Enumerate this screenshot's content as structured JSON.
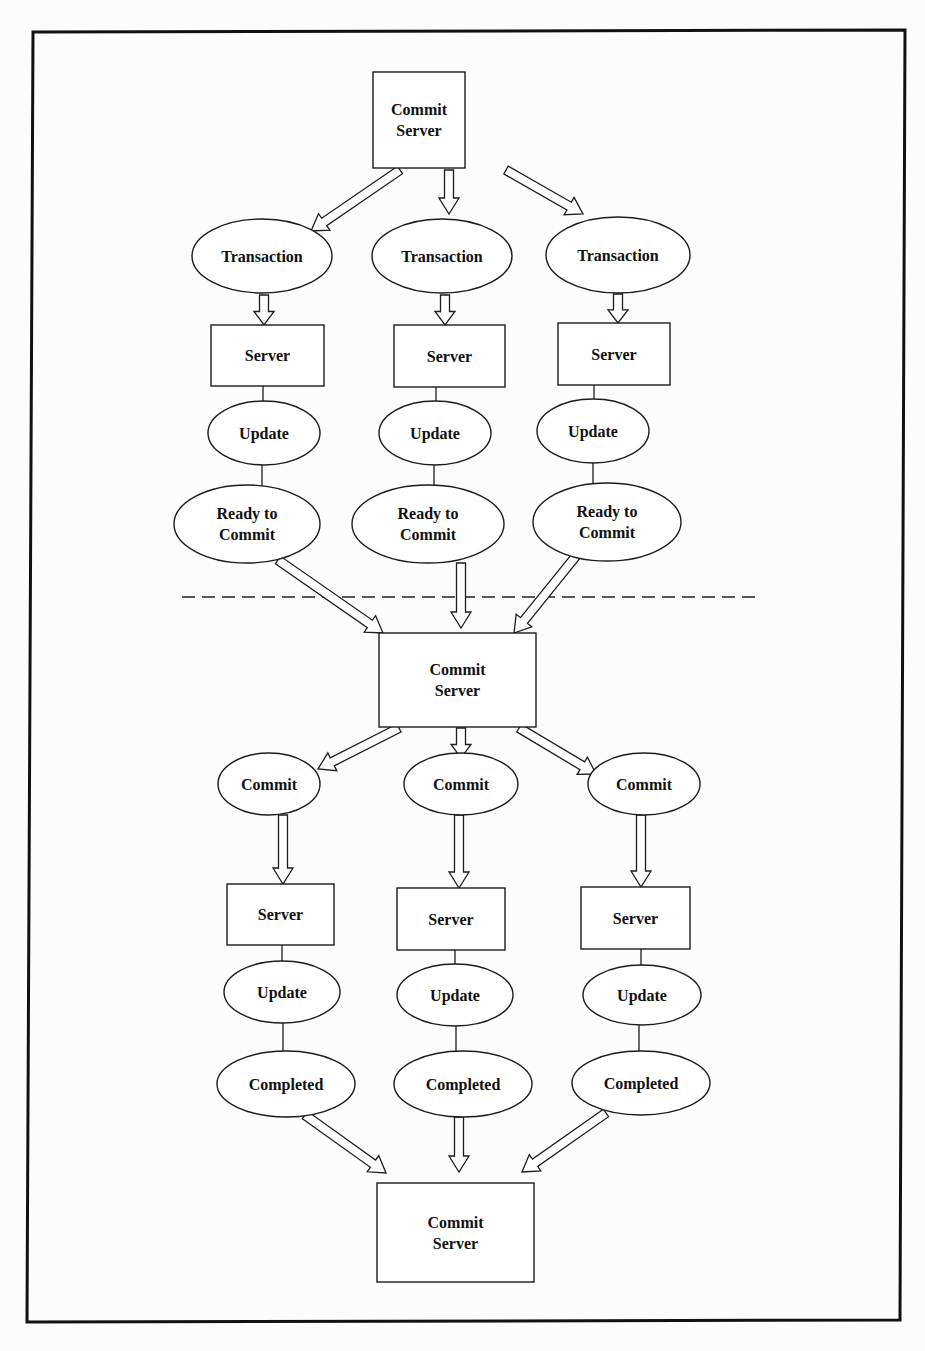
{
  "diagram": {
    "phase_divider": {
      "style": "dashed",
      "x1": 182,
      "x2": 762,
      "y": 597
    },
    "frame": {
      "corners": [
        [
          33,
          32
        ],
        [
          905,
          30
        ],
        [
          900,
          1320
        ],
        [
          27,
          1322
        ]
      ]
    },
    "nodes": [
      {
        "id": "commit-server-top",
        "shape": "rect",
        "lines": [
          "Commit",
          "Server"
        ],
        "x": 373,
        "y": 72,
        "w": 92,
        "h": 96
      },
      {
        "id": "transaction-1",
        "shape": "ellipse",
        "lines": [
          "Transaction"
        ],
        "cx": 262,
        "cy": 256,
        "rx": 70,
        "ry": 37
      },
      {
        "id": "transaction-2",
        "shape": "ellipse",
        "lines": [
          "Transaction"
        ],
        "cx": 442,
        "cy": 256,
        "rx": 70,
        "ry": 37
      },
      {
        "id": "transaction-3",
        "shape": "ellipse",
        "lines": [
          "Transaction"
        ],
        "cx": 618,
        "cy": 255,
        "rx": 72,
        "ry": 38
      },
      {
        "id": "server-p1-1",
        "shape": "rect",
        "lines": [
          "Server"
        ],
        "x": 211,
        "y": 325,
        "w": 113,
        "h": 61
      },
      {
        "id": "server-p1-2",
        "shape": "rect",
        "lines": [
          "Server"
        ],
        "x": 394,
        "y": 325,
        "w": 111,
        "h": 62
      },
      {
        "id": "server-p1-3",
        "shape": "rect",
        "lines": [
          "Server"
        ],
        "x": 558,
        "y": 323,
        "w": 112,
        "h": 62
      },
      {
        "id": "update-p1-1",
        "shape": "ellipse",
        "lines": [
          "Update"
        ],
        "cx": 264,
        "cy": 433,
        "rx": 56,
        "ry": 32
      },
      {
        "id": "update-p1-2",
        "shape": "ellipse",
        "lines": [
          "Update"
        ],
        "cx": 435,
        "cy": 433,
        "rx": 56,
        "ry": 32
      },
      {
        "id": "update-p1-3",
        "shape": "ellipse",
        "lines": [
          "Update"
        ],
        "cx": 593,
        "cy": 431,
        "rx": 56,
        "ry": 32
      },
      {
        "id": "ready-1",
        "shape": "ellipse",
        "lines": [
          "Ready to",
          "Commit"
        ],
        "cx": 247,
        "cy": 524,
        "rx": 73,
        "ry": 39
      },
      {
        "id": "ready-2",
        "shape": "ellipse",
        "lines": [
          "Ready to",
          "Commit"
        ],
        "cx": 428,
        "cy": 524,
        "rx": 76,
        "ry": 39
      },
      {
        "id": "ready-3",
        "shape": "ellipse",
        "lines": [
          "Ready to",
          "Commit"
        ],
        "cx": 607,
        "cy": 522,
        "rx": 74,
        "ry": 39
      },
      {
        "id": "commit-server-mid",
        "shape": "rect",
        "lines": [
          "Commit",
          "Server"
        ],
        "x": 379,
        "y": 633,
        "w": 157,
        "h": 94
      },
      {
        "id": "commit-1",
        "shape": "ellipse",
        "lines": [
          "Commit"
        ],
        "cx": 269,
        "cy": 784,
        "rx": 51,
        "ry": 31
      },
      {
        "id": "commit-2",
        "shape": "ellipse",
        "lines": [
          "Commit"
        ],
        "cx": 461,
        "cy": 784,
        "rx": 57,
        "ry": 31
      },
      {
        "id": "commit-3",
        "shape": "ellipse",
        "lines": [
          "Commit"
        ],
        "cx": 644,
        "cy": 784,
        "rx": 56,
        "ry": 31
      },
      {
        "id": "server-p2-1",
        "shape": "rect",
        "lines": [
          "Server"
        ],
        "x": 227,
        "y": 884,
        "w": 107,
        "h": 61
      },
      {
        "id": "server-p2-2",
        "shape": "rect",
        "lines": [
          "Server"
        ],
        "x": 397,
        "y": 888,
        "w": 108,
        "h": 62
      },
      {
        "id": "server-p2-3",
        "shape": "rect",
        "lines": [
          "Server"
        ],
        "x": 581,
        "y": 887,
        "w": 109,
        "h": 62
      },
      {
        "id": "update-p2-1",
        "shape": "ellipse",
        "lines": [
          "Update"
        ],
        "cx": 282,
        "cy": 992,
        "rx": 58,
        "ry": 31
      },
      {
        "id": "update-p2-2",
        "shape": "ellipse",
        "lines": [
          "Update"
        ],
        "cx": 455,
        "cy": 995,
        "rx": 58,
        "ry": 31
      },
      {
        "id": "update-p2-3",
        "shape": "ellipse",
        "lines": [
          "Update"
        ],
        "cx": 642,
        "cy": 995,
        "rx": 59,
        "ry": 30
      },
      {
        "id": "completed-1",
        "shape": "ellipse",
        "lines": [
          "Completed"
        ],
        "cx": 286,
        "cy": 1084,
        "rx": 69,
        "ry": 33
      },
      {
        "id": "completed-2",
        "shape": "ellipse",
        "lines": [
          "Completed"
        ],
        "cx": 463,
        "cy": 1084,
        "rx": 69,
        "ry": 33
      },
      {
        "id": "completed-3",
        "shape": "ellipse",
        "lines": [
          "Completed"
        ],
        "cx": 641,
        "cy": 1083,
        "rx": 69,
        "ry": 32
      },
      {
        "id": "commit-server-bottom",
        "shape": "rect",
        "lines": [
          "Commit",
          "Server"
        ],
        "x": 377,
        "y": 1183,
        "w": 157,
        "h": 99
      }
    ],
    "edges": [
      {
        "from": "commit-server-top",
        "to": "transaction-1",
        "type": "hollow-arrow",
        "x1": 400,
        "y1": 170,
        "x2": 311,
        "y2": 231
      },
      {
        "from": "commit-server-top",
        "to": "transaction-2",
        "type": "hollow-arrow",
        "x1": 449,
        "y1": 170,
        "x2": 449,
        "y2": 214
      },
      {
        "from": "commit-server-top",
        "to": "transaction-3",
        "type": "hollow-arrow",
        "x1": 506,
        "y1": 170,
        "x2": 583,
        "y2": 214
      },
      {
        "from": "transaction-1",
        "to": "server-p1-1",
        "type": "hollow-arrow",
        "x1": 264,
        "y1": 295,
        "x2": 264,
        "y2": 325
      },
      {
        "from": "transaction-2",
        "to": "server-p1-2",
        "type": "hollow-arrow",
        "x1": 445,
        "y1": 295,
        "x2": 445,
        "y2": 325
      },
      {
        "from": "transaction-3",
        "to": "server-p1-3",
        "type": "hollow-arrow",
        "x1": 618,
        "y1": 294,
        "x2": 618,
        "y2": 323
      },
      {
        "from": "server-p1-1",
        "to": "update-p1-1",
        "type": "line",
        "x1": 263,
        "y1": 386,
        "x2": 263,
        "y2": 401
      },
      {
        "from": "server-p1-2",
        "to": "update-p1-2",
        "type": "line",
        "x1": 436,
        "y1": 387,
        "x2": 436,
        "y2": 401
      },
      {
        "from": "server-p1-3",
        "to": "update-p1-3",
        "type": "line",
        "x1": 594,
        "y1": 385,
        "x2": 594,
        "y2": 399
      },
      {
        "from": "update-p1-1",
        "to": "ready-1",
        "type": "line",
        "x1": 262,
        "y1": 465,
        "x2": 262,
        "y2": 486
      },
      {
        "from": "update-p1-2",
        "to": "ready-2",
        "type": "line",
        "x1": 434,
        "y1": 465,
        "x2": 434,
        "y2": 485
      },
      {
        "from": "update-p1-3",
        "to": "ready-3",
        "type": "line",
        "x1": 593,
        "y1": 463,
        "x2": 593,
        "y2": 484
      },
      {
        "from": "ready-1",
        "to": "commit-server-mid",
        "type": "hollow-arrow",
        "x1": 278,
        "y1": 560,
        "x2": 383,
        "y2": 633
      },
      {
        "from": "ready-2",
        "to": "commit-server-mid",
        "type": "hollow-arrow",
        "x1": 461,
        "y1": 563,
        "x2": 461,
        "y2": 628
      },
      {
        "from": "ready-3",
        "to": "commit-server-mid",
        "type": "hollow-arrow",
        "x1": 576,
        "y1": 556,
        "x2": 514,
        "y2": 633
      },
      {
        "from": "commit-server-mid",
        "to": "commit-1",
        "type": "hollow-arrow",
        "x1": 399,
        "y1": 728,
        "x2": 318,
        "y2": 769
      },
      {
        "from": "commit-server-mid",
        "to": "commit-2",
        "type": "hollow-arrow",
        "x1": 461,
        "y1": 728,
        "x2": 461,
        "y2": 758
      },
      {
        "from": "commit-server-mid",
        "to": "commit-3",
        "type": "hollow-arrow",
        "x1": 519,
        "y1": 728,
        "x2": 596,
        "y2": 774
      },
      {
        "from": "commit-1",
        "to": "server-p2-1",
        "type": "hollow-arrow",
        "x1": 283,
        "y1": 815,
        "x2": 283,
        "y2": 884
      },
      {
        "from": "commit-2",
        "to": "server-p2-2",
        "type": "hollow-arrow",
        "x1": 459,
        "y1": 815,
        "x2": 459,
        "y2": 888
      },
      {
        "from": "commit-3",
        "to": "server-p2-3",
        "type": "hollow-arrow",
        "x1": 641,
        "y1": 815,
        "x2": 641,
        "y2": 887
      },
      {
        "from": "server-p2-1",
        "to": "update-p2-1",
        "type": "line",
        "x1": 282,
        "y1": 945,
        "x2": 282,
        "y2": 961
      },
      {
        "from": "server-p2-2",
        "to": "update-p2-2",
        "type": "line",
        "x1": 455,
        "y1": 950,
        "x2": 455,
        "y2": 964
      },
      {
        "from": "server-p2-3",
        "to": "update-p2-3",
        "type": "line",
        "x1": 641,
        "y1": 949,
        "x2": 641,
        "y2": 965
      },
      {
        "from": "update-p2-1",
        "to": "completed-1",
        "type": "line",
        "x1": 283,
        "y1": 1023,
        "x2": 283,
        "y2": 1051
      },
      {
        "from": "update-p2-2",
        "to": "completed-2",
        "type": "line",
        "x1": 456,
        "y1": 1026,
        "x2": 456,
        "y2": 1051
      },
      {
        "from": "update-p2-3",
        "to": "completed-3",
        "type": "line",
        "x1": 639,
        "y1": 1025,
        "x2": 639,
        "y2": 1051
      },
      {
        "from": "completed-1",
        "to": "commit-server-bottom",
        "type": "hollow-arrow",
        "x1": 305,
        "y1": 1115,
        "x2": 386,
        "y2": 1173
      },
      {
        "from": "completed-2",
        "to": "commit-server-bottom",
        "type": "hollow-arrow",
        "x1": 459,
        "y1": 1117,
        "x2": 459,
        "y2": 1172
      },
      {
        "from": "completed-3",
        "to": "commit-server-bottom",
        "type": "hollow-arrow",
        "x1": 606,
        "y1": 1113,
        "x2": 522,
        "y2": 1172
      }
    ]
  }
}
